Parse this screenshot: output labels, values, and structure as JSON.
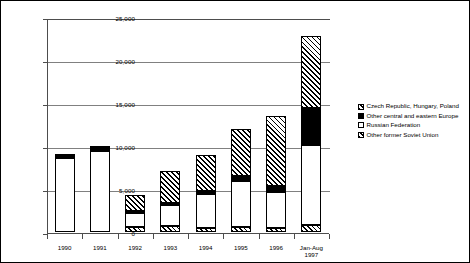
{
  "chart_data": {
    "type": "bar",
    "subtype": "stacked-vertical",
    "title": "",
    "subtitle": "",
    "xlabel": "",
    "ylabel": "",
    "ylim": [
      0,
      25000
    ],
    "ytick_values": [
      0,
      5000,
      10000,
      15000,
      20000,
      25000
    ],
    "ytick_labels": [
      "0",
      "5,000",
      "10,000",
      "15,000",
      "20,000",
      "25,000"
    ],
    "grid": "horizontal",
    "legend_position": "right",
    "categories": [
      "1990",
      "1991",
      "1992",
      "1993",
      "1994",
      "1995",
      "1996",
      "Jan-Aug\n1997"
    ],
    "series": [
      {
        "name": "Other former Soviet Union",
        "fill": "cross-hatch",
        "values": [
          0,
          0,
          600,
          750,
          500,
          600,
          450,
          800
        ]
      },
      {
        "name": "Russian Federation",
        "fill": "white",
        "values": [
          8550,
          9450,
          1600,
          2350,
          3900,
          5300,
          4150,
          9300
        ]
      },
      {
        "name": "Other central and eastern Europe",
        "fill": "solid-black",
        "values": [
          300,
          300,
          200,
          250,
          400,
          600,
          800,
          4300
        ]
      },
      {
        "name": "Czech Republic, Hungary, Poland",
        "fill": "diagonal-hatch",
        "values": [
          100,
          100,
          1900,
          3750,
          4100,
          5500,
          8100,
          8400
        ]
      }
    ],
    "totals": [
      8950,
      9850,
      4300,
      7100,
      8900,
      12000,
      13500,
      22800
    ],
    "legend_entries": [
      "Czech Republic, Hungary, Poland",
      "Other central and eastern Europe",
      "Russian Federation",
      "Other former Soviet Union"
    ]
  }
}
